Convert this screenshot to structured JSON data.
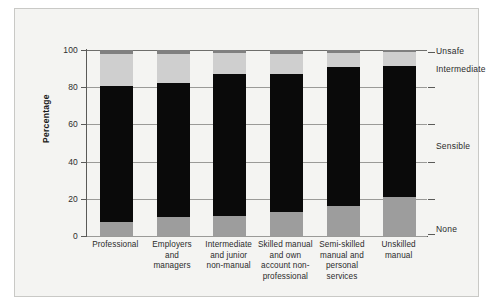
{
  "chart_data": {
    "type": "bar",
    "subtype": "stacked-bar-100",
    "title": "",
    "xlabel": "",
    "ylabel": "Percentage",
    "ylim": [
      0,
      100
    ],
    "yticks": [
      0,
      20,
      40,
      60,
      80,
      100
    ],
    "ytick_labels": [
      "0",
      "20",
      "40",
      "60",
      "80",
      "100"
    ],
    "grid": true,
    "legend_position": "right-band",
    "categories": [
      "Professional",
      "Employers and managers",
      "Intermediate and junior non-manual",
      "Skilled manual and own account non-professional",
      "Semi-skilled manual and personal services",
      "Unskilled manual"
    ],
    "category_lines": [
      [
        "Professional"
      ],
      [
        "Employers",
        "and",
        "managers"
      ],
      [
        "Intermediate",
        "and junior",
        "non-manual"
      ],
      [
        "Skilled manual",
        "and own",
        "account non-",
        "professional"
      ],
      [
        "Semi-skilled",
        "manual and",
        "personal",
        "services"
      ],
      [
        "Unskilled",
        "manual"
      ]
    ],
    "series": [
      {
        "name": "None",
        "color": "#9d9d9d",
        "values": [
          7.5,
          10,
          10.5,
          13,
          16,
          21
        ]
      },
      {
        "name": "Sensible",
        "color": "#0a0a0a",
        "values": [
          73,
          72.5,
          76.5,
          74,
          75,
          70.5
        ]
      },
      {
        "name": "Intermediate",
        "color": "#cfcfcf",
        "values": [
          17.5,
          15.5,
          11.5,
          11,
          7.5,
          7.5
        ]
      },
      {
        "name": "Unsafe",
        "color": "#808080",
        "values": [
          2,
          2,
          1.5,
          2,
          1.5,
          1
        ]
      }
    ],
    "segment_tops": [
      [
        7.5,
        80.5,
        98,
        100
      ],
      [
        10,
        82.5,
        98,
        100
      ],
      [
        10.5,
        87,
        98.5,
        100
      ],
      [
        13,
        87,
        98,
        100
      ],
      [
        16,
        91,
        98.5,
        100
      ],
      [
        21,
        91.5,
        99,
        100
      ]
    ],
    "band_labels": [
      {
        "text": "Unsafe",
        "at": 99
      },
      {
        "text": "Intermediate",
        "at": 89
      },
      {
        "text": "Sensible",
        "at": 48
      },
      {
        "text": "None",
        "at": 3
      }
    ],
    "band_ticks": [
      99,
      80,
      60,
      40,
      20,
      1
    ]
  }
}
